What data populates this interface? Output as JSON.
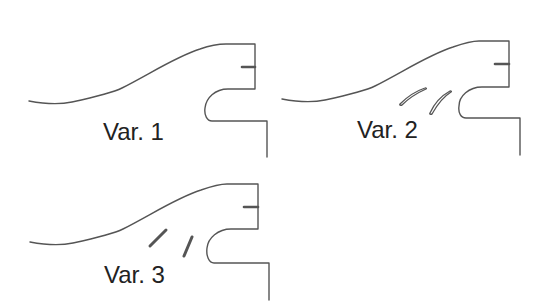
{
  "figure": {
    "variants": [
      {
        "id": "var1",
        "label": "Var. 1",
        "blades": "none"
      },
      {
        "id": "var2",
        "label": "Var. 2",
        "blades": "two curved guide vanes"
      },
      {
        "id": "var3",
        "label": "Var. 3",
        "blades": "two straight guide vanes"
      }
    ],
    "colors": {
      "stroke": "#555555",
      "text": "#222222",
      "background": "#ffffff"
    }
  }
}
